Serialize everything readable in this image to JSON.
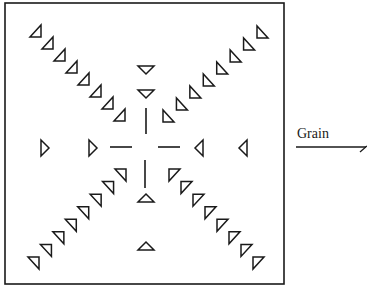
{
  "diagram": {
    "label": "Grain",
    "stroke_color": "#1a1a1a",
    "background": "#ffffff",
    "box": {
      "x": 5,
      "y": 3,
      "w": 279,
      "h": 281
    },
    "center": {
      "x": 146,
      "y": 148
    },
    "arms": {
      "top": [
        {
          "x": 146,
          "y": 70,
          "dir": "down"
        },
        {
          "x": 146,
          "y": 94,
          "dir": "down"
        }
      ],
      "bottom": [
        {
          "x": 146,
          "y": 198,
          "dir": "up"
        },
        {
          "x": 146,
          "y": 246,
          "dir": "up"
        }
      ],
      "left": [
        {
          "x": 45,
          "y": 148,
          "dir": "right"
        },
        {
          "x": 93,
          "y": 148,
          "dir": "right"
        }
      ],
      "right": [
        {
          "x": 199,
          "y": 148,
          "dir": "left"
        },
        {
          "x": 243,
          "y": 148,
          "dir": "left"
        }
      ]
    },
    "diagonals": {
      "top_left": {
        "from": [
          36,
          32
        ],
        "to": [
          120,
          116
        ],
        "count": 8,
        "type": "tl"
      },
      "top_right": {
        "from": [
          262,
          33
        ],
        "to": [
          168,
          117
        ],
        "count": 8,
        "type": "tr"
      },
      "bottom_left": {
        "from": [
          34,
          262
        ],
        "to": [
          121,
          174
        ],
        "count": 8,
        "type": "bl"
      },
      "bottom_right": {
        "from": [
          258,
          262
        ],
        "to": [
          174,
          174
        ],
        "count": 8,
        "type": "br"
      }
    }
  }
}
